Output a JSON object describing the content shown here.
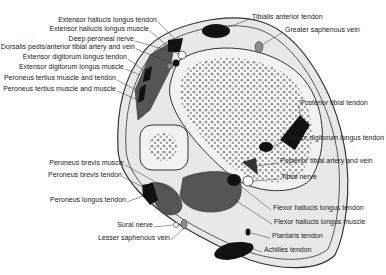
{
  "figure": {
    "type": "cross-section anatomical diagram"
  },
  "labels": {
    "left": [
      {
        "id": "ehl_tendon",
        "text": "Extensor hallucis longus tendon",
        "x": 157,
        "y": 20
      },
      {
        "id": "ehl_muscle",
        "text": "Extensor hallucis longus muscle",
        "x": 149,
        "y": 29
      },
      {
        "id": "deep_peroneal",
        "text": "Deep peroneal nerve",
        "x": 134,
        "y": 39
      },
      {
        "id": "dorsalis_pedis",
        "text": "Dorsalis pedis/anterior tibial artery and vein",
        "x": 135,
        "y": 47
      },
      {
        "id": "edl_tendon",
        "text": "Extensor digitorum longus tendon",
        "x": 127,
        "y": 57
      },
      {
        "id": "edl_muscle",
        "text": "Extensor digitorum longus muscle",
        "x": 124,
        "y": 67
      },
      {
        "id": "pt_tendon",
        "text": "Peroneus tertius muscle and tendon",
        "x": 116,
        "y": 78
      },
      {
        "id": "pt_muscle",
        "text": "Peroneus tertius muscle and muscle",
        "x": 116,
        "y": 89
      },
      {
        "id": "pb_muscle",
        "text": "Peroneus brevis muscle",
        "x": 124,
        "y": 163
      },
      {
        "id": "pb_tendon",
        "text": "Peroneus brevis tendon",
        "x": 122,
        "y": 175
      },
      {
        "id": "pl_tendon",
        "text": "Peroneus longus tendon",
        "x": 126,
        "y": 200
      },
      {
        "id": "sural",
        "text": "Sural nerve",
        "x": 153,
        "y": 225
      },
      {
        "id": "lesser_saph",
        "text": "Lesser saphenous vein",
        "x": 170,
        "y": 238
      }
    ],
    "right": [
      {
        "id": "tib_ant",
        "text": "Tibialis anterior tendon",
        "x": 252,
        "y": 17
      },
      {
        "id": "greater_saph",
        "text": "Greater saphenous vein",
        "x": 285,
        "y": 30
      },
      {
        "id": "post_tib",
        "text": "Posterior tibial tendon",
        "x": 300,
        "y": 103
      },
      {
        "id": "fdl_tendon",
        "text": "Flexor digitorum longus tendon",
        "x": 288,
        "y": 138
      },
      {
        "id": "pta",
        "text": "Posterior tibial artery and vein",
        "x": 280,
        "y": 161
      },
      {
        "id": "tib_nerve",
        "text": "Tibial nerve",
        "x": 281,
        "y": 177
      },
      {
        "id": "fhl_tendon",
        "text": "Flexor hallucis longus tendon",
        "x": 273,
        "y": 208
      },
      {
        "id": "fhl_muscle",
        "text": "Flexor hallucis longus muscle",
        "x": 274,
        "y": 222
      },
      {
        "id": "plantaris",
        "text": "Plantaris tendon",
        "x": 272,
        "y": 236
      },
      {
        "id": "achilles",
        "text": "Achilles tendon",
        "x": 264,
        "y": 250
      }
    ]
  },
  "colors": {
    "skin": "#e8e8e8",
    "outline": "#333333",
    "bone_fill": "#f2f2f2",
    "trabecular": "#9a9a9a",
    "muscle": "#555555",
    "tendon": "#111111",
    "vein": "#8a8a8a",
    "nerve": "#ffffff"
  }
}
